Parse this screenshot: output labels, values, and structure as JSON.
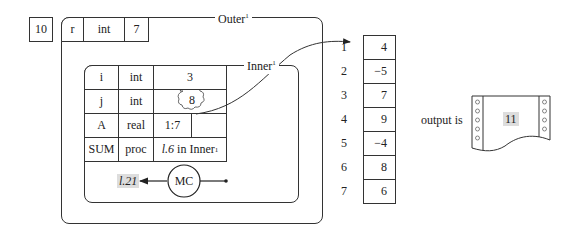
{
  "free_cell": {
    "value": "10"
  },
  "outer": {
    "title": "Outer",
    "title_sup": "1",
    "header": {
      "name": "r",
      "type": "int",
      "value": "7"
    }
  },
  "inner": {
    "title": "Inner",
    "title_sup": "1",
    "rows": [
      {
        "name": "i",
        "type": "int",
        "value": "3"
      },
      {
        "name": "j",
        "type": "int",
        "value": "8"
      },
      {
        "name": "A",
        "type": "real",
        "value": "1:7",
        "value2": ""
      },
      {
        "name": "SUM",
        "type": "proc",
        "value_italic": "l.6",
        "value_rest": " in Inner",
        "value_sup": "1"
      }
    ],
    "mc": {
      "label": "MC",
      "return_line": "l.21"
    }
  },
  "array": {
    "indices": [
      "1",
      "2",
      "3",
      "4",
      "5",
      "6",
      "7"
    ],
    "values": [
      "4",
      "−5",
      "7",
      "9",
      "−4",
      "8",
      "6"
    ]
  },
  "output": {
    "label": "output is",
    "value": "11"
  }
}
